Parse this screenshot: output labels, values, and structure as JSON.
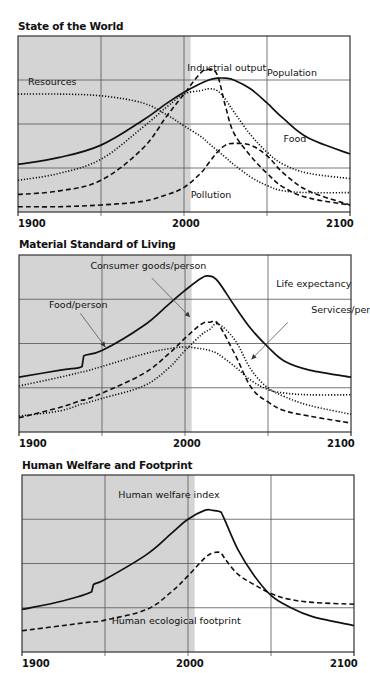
{
  "chart_data": [
    {
      "type": "line",
      "title": "State of the World",
      "xlabel": "",
      "ylabel": "",
      "x_range": [
        1900,
        2100
      ],
      "y_range": [
        0,
        100
      ],
      "x_ticks": [
        "1900",
        "2000",
        "2100"
      ],
      "grid": true,
      "shaded_region": [
        1900,
        2004
      ],
      "x": [
        1900,
        1925,
        1950,
        1975,
        1990,
        2000,
        2010,
        2015,
        2020,
        2025,
        2030,
        2040,
        2050,
        2060,
        2075,
        2100
      ],
      "series": [
        {
          "name": "Population",
          "style": "solid",
          "values": [
            27,
            31,
            38,
            52,
            62,
            68,
            73,
            75,
            76,
            76,
            75,
            70,
            62,
            53,
            42,
            33
          ]
        },
        {
          "name": "Industrial output",
          "style": "dashed",
          "values": [
            10,
            12,
            18,
            36,
            55,
            67,
            79,
            81,
            78,
            60,
            45,
            32,
            22,
            14,
            8,
            4
          ]
        },
        {
          "name": "Food",
          "style": "dotted",
          "values": [
            18,
            22,
            30,
            48,
            60,
            67,
            69,
            70,
            69,
            64,
            57,
            44,
            34,
            27,
            22,
            19
          ]
        },
        {
          "name": "Resources",
          "style": "dotted",
          "values": [
            67,
            67,
            66,
            62,
            55,
            49,
            43,
            39,
            35,
            31,
            27,
            20,
            15,
            12,
            11,
            11
          ]
        },
        {
          "name": "Pollution",
          "style": "dashed",
          "values": [
            3,
            3,
            4,
            6,
            10,
            14,
            22,
            28,
            34,
            38,
            39,
            38,
            32,
            22,
            12,
            4
          ]
        }
      ],
      "annotations": [
        {
          "text": "Industrial output",
          "x": 2002,
          "y": 80
        },
        {
          "text": "Population",
          "x": 2050,
          "y": 77
        },
        {
          "text": "Resources",
          "x": 1906,
          "y": 72
        },
        {
          "text": "Food",
          "x": 2060,
          "y": 40
        },
        {
          "text": "Pollution",
          "x": 2004,
          "y": 8
        }
      ]
    },
    {
      "type": "line",
      "title": "Material Standard of Living",
      "xlabel": "",
      "ylabel": "",
      "x_range": [
        1900,
        2100
      ],
      "y_range": [
        0,
        100
      ],
      "x_ticks": [
        "1900",
        "2000",
        "2100"
      ],
      "grid": true,
      "shaded_region": [
        1900,
        2004
      ],
      "x": [
        1900,
        1925,
        1938,
        1939,
        1950,
        1975,
        1990,
        2000,
        2010,
        2015,
        2020,
        2030,
        2040,
        2050,
        2060,
        2075,
        2100
      ],
      "series": [
        {
          "name": "Life expectancy",
          "style": "solid",
          "values": [
            31,
            35,
            37,
            43,
            46,
            60,
            72,
            80,
            87,
            88,
            85,
            71,
            58,
            48,
            40,
            35,
            31
          ]
        },
        {
          "name": "Food/person",
          "style": "dotted",
          "values": [
            26,
            31,
            34,
            34,
            37,
            44,
            47,
            48,
            47,
            46,
            44,
            37,
            29,
            24,
            22,
            21,
            21
          ]
        },
        {
          "name": "Consumer goods/person",
          "style": "dashed",
          "values": [
            8,
            14,
            18,
            18,
            22,
            33,
            44,
            53,
            61,
            62,
            61,
            44,
            25,
            17,
            12,
            9,
            5
          ]
        },
        {
          "name": "Services/person",
          "style": "dotted",
          "values": [
            9,
            12,
            16,
            16,
            19,
            26,
            36,
            46,
            55,
            58,
            61,
            52,
            35,
            25,
            20,
            15,
            10
          ]
        }
      ],
      "annotations": [
        {
          "text": "Consumer goods/person",
          "x": 1943,
          "y": 92
        },
        {
          "text": "Life expectancy",
          "x": 2055,
          "y": 82
        },
        {
          "text": "Food/person",
          "x": 1918,
          "y": 70
        },
        {
          "text": "Services/person",
          "x": 2076,
          "y": 67
        }
      ]
    },
    {
      "type": "line",
      "title": "Human Welfare and Footprint",
      "xlabel": "",
      "ylabel": "",
      "x_range": [
        1900,
        2100
      ],
      "y_range": [
        0,
        100
      ],
      "x_ticks": [
        "1900",
        "2000",
        "2100"
      ],
      "grid": true,
      "shaded_region": [
        1900,
        2004
      ],
      "x": [
        1900,
        1925,
        1942,
        1943,
        1950,
        1975,
        1990,
        2000,
        2010,
        2015,
        2020,
        2022,
        2030,
        2040,
        2050,
        2060,
        2075,
        2100
      ],
      "series": [
        {
          "name": "Human welfare index",
          "style": "solid",
          "values": [
            24,
            29,
            34,
            38,
            41,
            55,
            67,
            75,
            80,
            80,
            79,
            75,
            58,
            43,
            32,
            26,
            20,
            15
          ]
        },
        {
          "name": "Human ecological footprint",
          "style": "dashed",
          "values": [
            12,
            15,
            17,
            17,
            18,
            24,
            34,
            43,
            53,
            56,
            56,
            53,
            44,
            38,
            33,
            30,
            28,
            27
          ]
        }
      ],
      "annotations": [
        {
          "text": "Human welfare index",
          "x": 1958,
          "y": 87
        },
        {
          "text": "Human ecological footprint",
          "x": 1954,
          "y": 16
        }
      ]
    }
  ],
  "charts": [
    {
      "title": "State of the World",
      "ticks": [
        "1900",
        "2000",
        "2100"
      ]
    },
    {
      "title": "Material Standard of Living",
      "ticks": [
        "1900",
        "2000",
        "2100"
      ]
    },
    {
      "title": "Human Welfare and Footprint",
      "ticks": [
        "1900",
        "2000",
        "2100"
      ]
    }
  ],
  "colors": {
    "shade": "#d4d4d4",
    "grid": "#555555",
    "line": "#111111",
    "frame": "#333333"
  }
}
